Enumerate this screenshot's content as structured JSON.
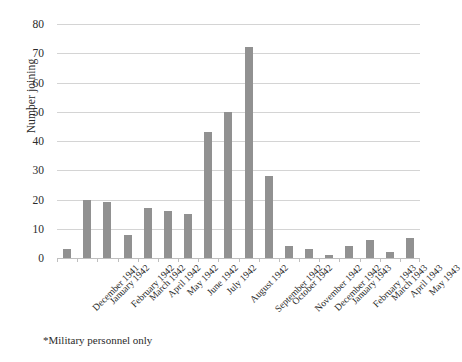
{
  "chart_data": {
    "type": "bar",
    "title": "",
    "xlabel": "",
    "ylabel": "Number joining",
    "ylim": [
      0,
      80
    ],
    "yticks": [
      0,
      10,
      20,
      30,
      40,
      50,
      60,
      70,
      80
    ],
    "grid": true,
    "legend": "none",
    "bar_color": "#919191",
    "gridline_color": "#d4d4d4",
    "categories": [
      "December 1941",
      "January 1942",
      "February 1942",
      "March 1942",
      "April 1942",
      "May 1942",
      "June 1942",
      "July 1942",
      "August 1942",
      "September 1942",
      "October 1942",
      "November 1942",
      "December 1942",
      "January 1943",
      "February 1943",
      "March 1943",
      "April 1943",
      "May 1943"
    ],
    "values": [
      3,
      20,
      19,
      8,
      17,
      16,
      15,
      43,
      50,
      72,
      28,
      4,
      3,
      1,
      4,
      6,
      2,
      7
    ],
    "annotations": [
      "*Military personnel only"
    ]
  },
  "footnote": "*Military personnel only"
}
